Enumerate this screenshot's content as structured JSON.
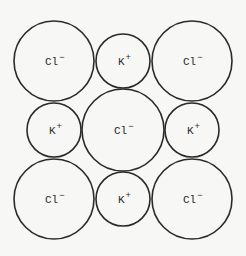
{
  "diagram": {
    "type": "ionic-crystal-lattice-cross-section",
    "rows": [
      [
        {
          "symbol": "Cl",
          "charge": "−",
          "kind": "anion"
        },
        {
          "symbol": "K",
          "charge": "+",
          "kind": "cation"
        },
        {
          "symbol": "Cl",
          "charge": "−",
          "kind": "anion"
        }
      ],
      [
        {
          "symbol": "K",
          "charge": "+",
          "kind": "cation"
        },
        {
          "symbol": "Cl",
          "charge": "−",
          "kind": "anion"
        },
        {
          "symbol": "K",
          "charge": "+",
          "kind": "cation"
        }
      ],
      [
        {
          "symbol": "Cl",
          "charge": "−",
          "kind": "anion"
        },
        {
          "symbol": "K",
          "charge": "+",
          "kind": "cation"
        },
        {
          "symbol": "Cl",
          "charge": "−",
          "kind": "anion"
        }
      ]
    ],
    "colors": {
      "stroke": "#2a2a2a",
      "text": "#2a2a2a",
      "background": "#f7f7f5"
    }
  }
}
